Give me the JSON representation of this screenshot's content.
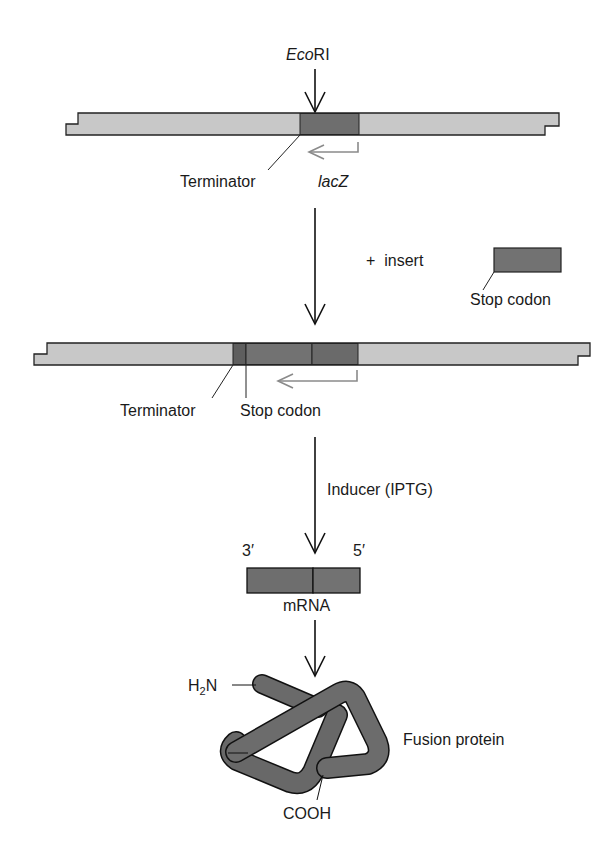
{
  "diagram": {
    "type": "lacZ fusion cloning schematic",
    "colors": {
      "vector_fill": "#c8c8c8",
      "gene_fill": "#6e6e6e",
      "insert_fill": "#727272",
      "outline": "#222222",
      "lacz_arrow": "#888888",
      "protein_fill": "#6a6a6a"
    },
    "step1": {
      "enzyme_label_italic": "Eco",
      "enzyme_label_roman": "RI",
      "terminator_label": "Terminator",
      "gene_label": "lacZ"
    },
    "step2": {
      "plus_label": "+  insert",
      "insert_label": "Stop codon"
    },
    "step3": {
      "terminator_label": "Terminator",
      "stop_codon_label": "Stop codon"
    },
    "step4": {
      "inducer_label": "Inducer (IPTG)",
      "mrna_3prime": "3′",
      "mrna_5prime": "5′",
      "mrna_label": "mRNA"
    },
    "step5": {
      "n_terminus_main": "H",
      "n_terminus_sub": "2",
      "n_terminus_end": "N",
      "c_terminus": "COOH",
      "protein_label": "Fusion protein"
    }
  }
}
